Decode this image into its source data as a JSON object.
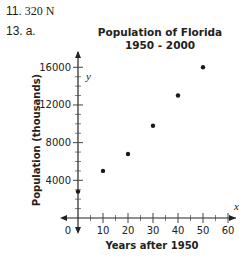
{
  "problems": {
    "p11": {
      "number": "11.",
      "answer": "320 N"
    },
    "p13": {
      "number": "13.",
      "part": "a."
    }
  },
  "chart_data": {
    "type": "scatter",
    "title": "Population of Florida",
    "subtitle": "1950 - 2000",
    "xlabel": "Years after 1950",
    "ylabel": "Population (thousands)",
    "x_axis_var": "x",
    "y_axis_var": "y",
    "x_ticks": [
      "0",
      "10",
      "20",
      "30",
      "40",
      "50",
      "60"
    ],
    "y_ticks": [
      "4000",
      "8000",
      "12000",
      "16000"
    ],
    "xlim": [
      0,
      60
    ],
    "ylim": [
      0,
      16000
    ],
    "grid": false,
    "legend": "none",
    "x": [
      0,
      10,
      20,
      30,
      40,
      50
    ],
    "values": [
      2800,
      5000,
      6800,
      9800,
      13000,
      16000
    ],
    "point_color": "#1a1a1a"
  }
}
